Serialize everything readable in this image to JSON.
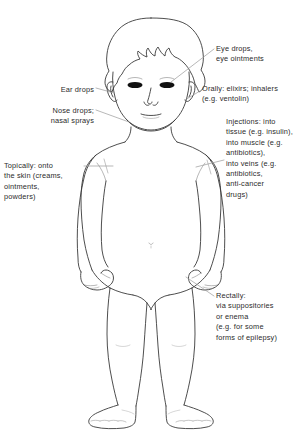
{
  "diagram": {
    "colors": {
      "background": "#ffffff",
      "outline": "#3a3a3a",
      "leader_line": "#9a9a9a",
      "text": "#2b2b2b",
      "eye_fill": "#111111"
    },
    "labels": [
      {
        "id": "eye-drops",
        "text": "Eye drops,\neye ointments",
        "side": "right",
        "target": "eyes"
      },
      {
        "id": "orally",
        "text": "Orally: elixirs; inhalers\n(e.g. ventolin)",
        "side": "right",
        "target": "mouth"
      },
      {
        "id": "injections",
        "text": "Injections: into\ntissue (e.g. insulin),\ninto muscle (e.g.\n  antibiotics),\n  into veins (e.g.\n  antibiotics,\n  anti-cancer\n  drugs)",
        "side": "right",
        "target": "arm"
      },
      {
        "id": "rectally",
        "text": "Rectally:\nvia suppositories\nor enema\n(e.g. for some\nforms of epilepsy)",
        "side": "right",
        "target": "buttocks"
      },
      {
        "id": "ear-drops",
        "text": "Ear drops",
        "side": "left",
        "target": "ear"
      },
      {
        "id": "nose-drops",
        "text": "Nose drops;\nnasal sprays",
        "side": "left",
        "target": "nose"
      },
      {
        "id": "topically",
        "text": "Topically: onto\nthe skin (creams,\nointments,\npowders)",
        "side": "left",
        "target": "skin-arm"
      }
    ]
  }
}
